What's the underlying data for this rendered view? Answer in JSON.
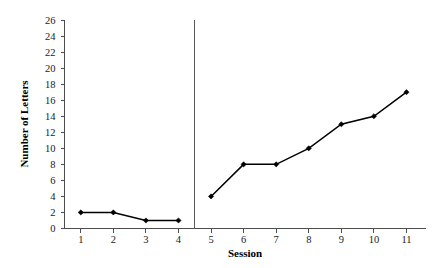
{
  "chart_data": {
    "type": "line",
    "title": "",
    "xlabel": "Session",
    "ylabel": "Number of Letters",
    "x": [
      1,
      2,
      3,
      4,
      5,
      6,
      7,
      8,
      9,
      10,
      11
    ],
    "xtick_labels": [
      "1",
      "2",
      "3",
      "4",
      "5",
      "6",
      "7",
      "8",
      "9",
      "10",
      "11"
    ],
    "ytick_labels": [
      "0",
      "2",
      "4",
      "6",
      "8",
      "10",
      "12",
      "14",
      "16",
      "18",
      "20",
      "22",
      "24",
      "26"
    ],
    "ytick_values": [
      0,
      2,
      4,
      6,
      8,
      10,
      12,
      14,
      16,
      18,
      20,
      22,
      24,
      26
    ],
    "xlim": [
      0.5,
      11.6
    ],
    "ylim": [
      0,
      26
    ],
    "grid": false,
    "legend": null,
    "marker": "diamond",
    "line_color": "#000000",
    "series": [
      {
        "name": "Baseline",
        "x": [
          1,
          2,
          3,
          4
        ],
        "values": [
          2,
          2,
          1,
          1
        ]
      },
      {
        "name": "Intervention",
        "x": [
          5,
          6,
          7,
          8,
          9,
          10,
          11
        ],
        "values": [
          4,
          8,
          8,
          10,
          13,
          14,
          17
        ]
      }
    ],
    "annotations": [
      {
        "type": "phase-divider",
        "orientation": "vertical",
        "x": 4.5,
        "label": ""
      }
    ]
  }
}
